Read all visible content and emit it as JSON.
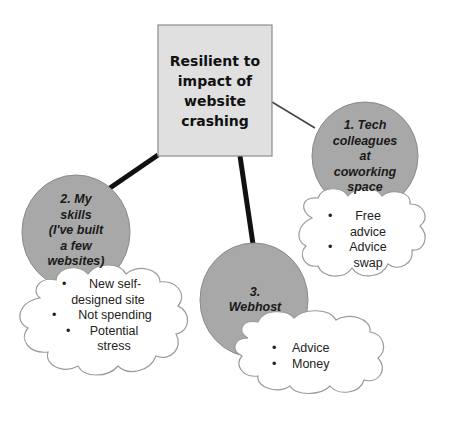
{
  "central": {
    "title": "Resilient to impact of website crashing",
    "lines": [
      "Resilient to",
      "impact of",
      "website",
      "crashing"
    ],
    "fill": "#e0e0e0"
  },
  "nodes": [
    {
      "id": 1,
      "label_lines": [
        "1.  Tech",
        "colleagues",
        "at",
        "coworking",
        "space"
      ],
      "connector": "thin",
      "benefits": [
        {
          "lines": [
            "Free",
            "advice"
          ]
        },
        {
          "lines": [
            "Advice",
            "swap"
          ]
        }
      ]
    },
    {
      "id": 2,
      "label_lines": [
        "2.  My",
        "skills",
        "(I've built",
        "a few",
        "websites)"
      ],
      "connector": "thick",
      "benefits": [
        {
          "lines": [
            "New self-",
            "designed site"
          ]
        },
        {
          "lines": [
            "Not spending"
          ]
        },
        {
          "lines": [
            "Potential",
            "stress"
          ]
        }
      ]
    },
    {
      "id": 3,
      "label_lines": [
        "3.",
        "Webhost"
      ],
      "connector": "thick",
      "benefits": [
        {
          "lines": [
            "Advice"
          ]
        },
        {
          "lines": [
            "Money"
          ]
        }
      ]
    }
  ],
  "colors": {
    "circle_fill": "#a8a8a8",
    "circle_stroke": "#8a8a8a",
    "cloud_fill": "#ffffff",
    "cloud_stroke": "#9a9a9a",
    "box_stroke": "#8c8c8c",
    "line": "#111111"
  },
  "bullet": "•"
}
